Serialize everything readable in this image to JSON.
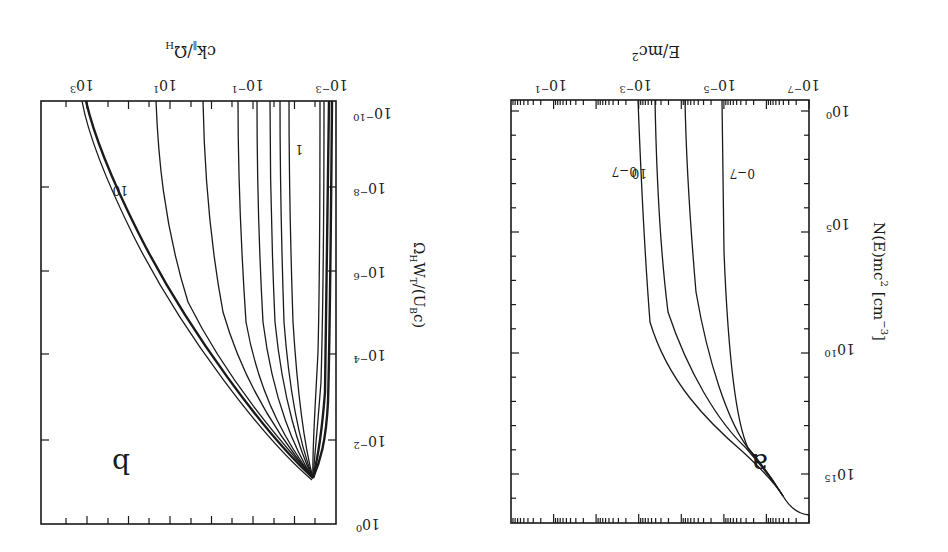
{
  "figure": {
    "orientation": "rotated 180 degrees",
    "background": "#ffffff",
    "ink": "#1a1a1a"
  },
  "chart_data": [
    {
      "panel": "a",
      "type": "line",
      "title": "",
      "panel_label": "a",
      "xlabel": "E/mc²",
      "ylabel": "N(E)mc² [cm⁻³]",
      "xscale": "log",
      "yscale": "log",
      "xlim": [
        1e-07,
        1
      ],
      "ylim": [
        1,
        1e+16
      ],
      "x_ticks": [
        "10⁻⁷",
        "10⁻⁵",
        "10⁻³",
        "10⁻¹"
      ],
      "y_ticks": [
        "10⁰",
        "10⁵",
        "10¹⁰",
        "10¹⁵"
      ],
      "grid": false,
      "annotations": [
        "0-7",
        "10"
      ],
      "series": [
        {
          "name": "0-7",
          "x": [
            1e-07,
            1e-06,
            3e-06,
            1e-05,
            1.2e-05,
            1.3e-05
          ],
          "y": [
            1.6e+16,
            8000000000000000.0,
            2000000000000000.0,
            30000000000000.0,
            100000000.0,
            1
          ]
        },
        {
          "name": "mid-1",
          "x": [
            1e-07,
            1e-06,
            3e-06,
            1e-05,
            5e-05,
            0.00013
          ],
          "y": [
            1.6e+16,
            8000000000000000.0,
            2000000000000000.0,
            30000000000000.0,
            1000000000.0,
            1
          ]
        },
        {
          "name": "mid-2",
          "x": [
            1e-07,
            1e-06,
            3e-06,
            2e-05,
            0.0002,
            0.0006
          ],
          "y": [
            1.6e+16,
            8000000000000000.0,
            2000000000000000.0,
            10000000000000.0,
            1000000000.0,
            1
          ]
        },
        {
          "name": "10",
          "x": [
            1e-07,
            1e-06,
            3e-06,
            3e-05,
            0.0005,
            0.0013
          ],
          "y": [
            1.6e+16,
            8000000000000000.0,
            2000000000000000.0,
            6000000000000.0,
            1000000000.0,
            1
          ]
        }
      ]
    },
    {
      "panel": "b",
      "type": "line",
      "title": "",
      "panel_label": "b",
      "xlabel": "ck∥/Ω_H",
      "ylabel": "Ω_H W_T/(U_B c)",
      "xscale": "log",
      "yscale": "log",
      "xlim": [
        0.001,
        10000.0
      ],
      "ylim": [
        1e-10,
        1
      ],
      "x_ticks": [
        "10⁻³",
        "10⁻¹",
        "10¹",
        "10³"
      ],
      "y_ticks": [
        "10⁻¹⁰",
        "10⁻⁸",
        "10⁻⁶",
        "10⁻⁴",
        "10⁻²",
        "10⁰"
      ],
      "grid": false,
      "annotations": [
        "1",
        "10"
      ],
      "series_description": "Family of ~12 curves; all converge to a minimum near (ck/Ω_H≈4e-3, W≈1e-1). Lower-index curves stay near ck≈1e-3..1e-2 (dense band); higher-index curves fan out toward larger ck at small W, with curve '10' reaching ck≈1e3 at W=1e-10.",
      "series": [
        {
          "name": "band (0)",
          "x": [
            0.004,
            0.0025,
            0.0018,
            0.0015,
            0.0014
          ],
          "y": [
            0.1,
            0.01,
            0.0001,
            1e-07,
            1e-10
          ]
        },
        {
          "name": "1",
          "x": [
            0.004,
            0.005,
            0.015,
            0.025,
            0.028
          ],
          "y": [
            0.1,
            0.03,
            0.0001,
            1e-07,
            1e-10
          ]
        },
        {
          "name": "2",
          "x": [
            0.004,
            0.006,
            0.025,
            0.04,
            0.045
          ],
          "y": [
            0.1,
            0.03,
            0.0001,
            1e-07,
            1e-10
          ]
        },
        {
          "name": "3",
          "x": [
            0.004,
            0.007,
            0.04,
            0.07,
            0.08
          ],
          "y": [
            0.1,
            0.03,
            0.0001,
            1e-07,
            1e-10
          ]
        },
        {
          "name": "4",
          "x": [
            0.004,
            0.009,
            0.08,
            0.15,
            0.17
          ],
          "y": [
            0.1,
            0.03,
            0.0001,
            1e-07,
            1e-10
          ]
        },
        {
          "name": "5",
          "x": [
            0.004,
            0.012,
            0.18,
            0.35,
            0.4
          ],
          "y": [
            0.1,
            0.03,
            0.0001,
            1e-07,
            1e-10
          ]
        },
        {
          "name": "6",
          "x": [
            0.004,
            0.016,
            0.5,
            2,
            3
          ],
          "y": [
            0.1,
            0.03,
            0.0001,
            1e-07,
            1e-10
          ]
        },
        {
          "name": "7",
          "x": [
            0.004,
            0.02,
            1.5,
            20,
            40
          ],
          "y": [
            0.1,
            0.03,
            0.0001,
            1e-07,
            1e-10
          ]
        },
        {
          "name": "10",
          "x": [
            0.004,
            0.025,
            3,
            100,
            1000
          ],
          "y": [
            0.1,
            0.03,
            0.0001,
            1e-07,
            1e-10
          ]
        }
      ]
    }
  ],
  "panel_a": {
    "label": "a",
    "xlabel": "E/mc",
    "xlabel_sup": "2",
    "ylabel_main": "N(E)mc",
    "ylabel_sup": "2",
    "ylabel_unit": "[cm",
    "ylabel_unit_sup": "−3",
    "ylabel_unit_close": "]",
    "x_ticks": [
      {
        "base": "10",
        "exp": "−7"
      },
      {
        "base": "10",
        "exp": "−5"
      },
      {
        "base": "10",
        "exp": "−3"
      },
      {
        "base": "10",
        "exp": "−1"
      }
    ],
    "y_ticks": [
      {
        "base": "10",
        "exp": "0"
      },
      {
        "base": "10",
        "exp": "5"
      },
      {
        "base": "10",
        "exp": "10"
      },
      {
        "base": "10",
        "exp": "15"
      }
    ],
    "annotation_low": "0−7",
    "annotation_high": "10"
  },
  "panel_b": {
    "label": "b",
    "xlabel_main": "ck",
    "xlabel_sub": "∥",
    "xlabel_div": "/Ω",
    "xlabel_sub2": "H",
    "ylabel_main": "Ω",
    "ylabel_sub": "H",
    "ylabel_w": "W",
    "ylabel_wsub": "T",
    "ylabel_rest": "/(U",
    "ylabel_bsub": "B",
    "ylabel_end": "c)",
    "x_ticks": [
      {
        "base": "10",
        "exp": "−3"
      },
      {
        "base": "10",
        "exp": "−1"
      },
      {
        "base": "10",
        "exp": "1"
      },
      {
        "base": "10",
        "exp": "3"
      }
    ],
    "y_ticks": [
      {
        "base": "10",
        "exp": "−10"
      },
      {
        "base": "10",
        "exp": "−8"
      },
      {
        "base": "10",
        "exp": "−6"
      },
      {
        "base": "10",
        "exp": "−4"
      },
      {
        "base": "10",
        "exp": "−2"
      },
      {
        "base": "10",
        "exp": "0"
      }
    ],
    "annotation_low": "1",
    "annotation_high": "10"
  }
}
